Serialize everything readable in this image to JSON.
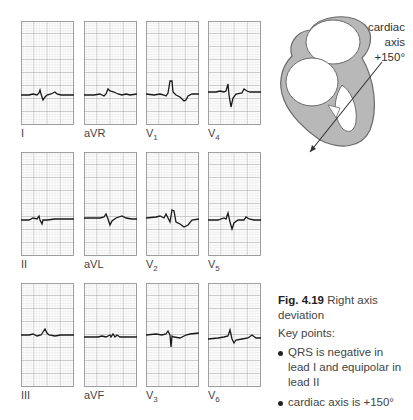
{
  "figure": {
    "number": "Fig. 4.19",
    "title": "Right axis deviation",
    "key_points_heading": "Key points:",
    "key_points": [
      "QRS is negative in lead I and equipolar in lead II",
      "cardiac axis is +150°"
    ]
  },
  "heart_diagram": {
    "axis_label_line1": "cardiac",
    "axis_label_line2": "axis",
    "axis_value": "+150°"
  },
  "leads": [
    {
      "name": "I",
      "base": "I",
      "sub": ""
    },
    {
      "name": "aVR",
      "base": "aVR",
      "sub": ""
    },
    {
      "name": "V1",
      "base": "V",
      "sub": "1"
    },
    {
      "name": "V4",
      "base": "V",
      "sub": "4"
    },
    {
      "name": "II",
      "base": "II",
      "sub": ""
    },
    {
      "name": "aVL",
      "base": "aVL",
      "sub": ""
    },
    {
      "name": "V2",
      "base": "V",
      "sub": "2"
    },
    {
      "name": "V5",
      "base": "V",
      "sub": "5"
    },
    {
      "name": "III",
      "base": "III",
      "sub": ""
    },
    {
      "name": "aVF",
      "base": "aVF",
      "sub": ""
    },
    {
      "name": "V3",
      "base": "V",
      "sub": "3"
    },
    {
      "name": "V6",
      "base": "V",
      "sub": "6"
    }
  ],
  "colors": {
    "grid_fine": "#c8c8c8",
    "grid_major": "#8a8a8a",
    "trace": "#1a1a1a",
    "heart_wall": "#b0b0b0",
    "heart_outline": "#6a6a6a"
  }
}
